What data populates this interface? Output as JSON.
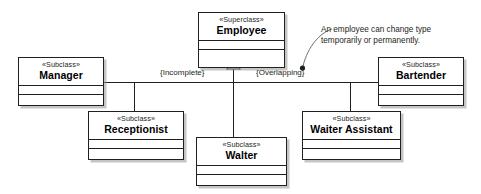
{
  "diagram": {
    "type": "uml-class-diagram",
    "stereotype_superclass": "«Superclass»",
    "stereotype_subclass": "«Subclass»",
    "classes": [
      {
        "id": "employee",
        "name": "Employee",
        "stereotype": "«Superclass»",
        "role": "superclass"
      },
      {
        "id": "manager",
        "name": "Manager",
        "stereotype": "«Subclass»",
        "role": "subclass"
      },
      {
        "id": "receptionist",
        "name": "Receptionist",
        "stereotype": "«Subclass»",
        "role": "subclass"
      },
      {
        "id": "walter",
        "name": "Walter",
        "stereotype": "«Subclass»",
        "role": "subclass"
      },
      {
        "id": "waiter_assistant",
        "name": "Waiter Assistant",
        "stereotype": "«Subclass»",
        "role": "subclass"
      },
      {
        "id": "bartender",
        "name": "Bartender",
        "stereotype": "«Subclass»",
        "role": "subclass"
      }
    ],
    "constraints": [
      {
        "id": "incomplete",
        "label": "{Incomplete}"
      },
      {
        "id": "overlapping",
        "label": "{Overlapping}"
      }
    ],
    "note": {
      "line1": "An employee can change type",
      "line2": "temporarily or permanently."
    },
    "colors": {
      "stroke": "#231f20",
      "fill": "#ffffff",
      "shadow": "#969696",
      "text": "#000000",
      "background": "#ffffff"
    }
  }
}
